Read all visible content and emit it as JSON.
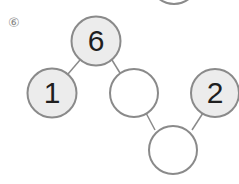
{
  "problem": {
    "number_label": "⑥",
    "nodes": [
      {
        "id": "top",
        "value": "6",
        "filled": true
      },
      {
        "id": "left",
        "value": "1",
        "filled": true
      },
      {
        "id": "middle",
        "value": "",
        "filled": false
      },
      {
        "id": "right",
        "value": "2",
        "filled": true
      },
      {
        "id": "bottom",
        "value": "",
        "filled": false
      }
    ]
  },
  "colors": {
    "stroke": "#8a8a8a",
    "filled": "#ececec",
    "empty": "#ffffff",
    "text": "#1f1f1f"
  }
}
